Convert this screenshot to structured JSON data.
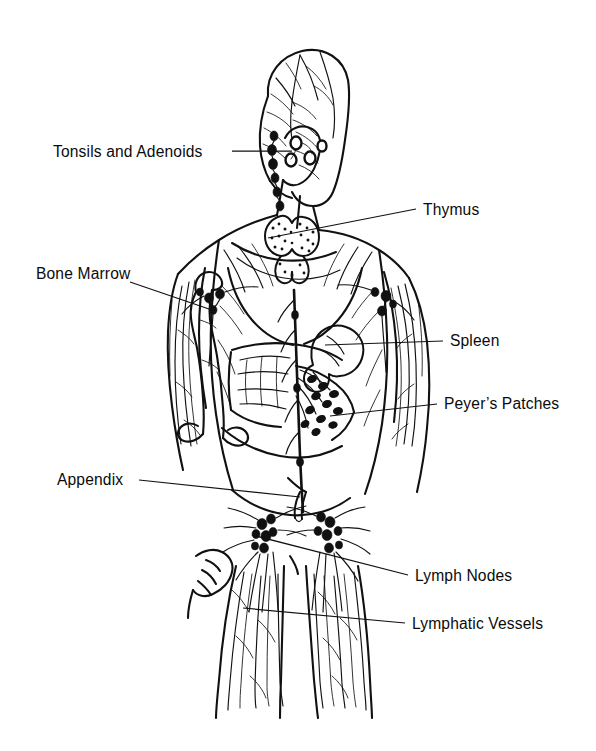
{
  "figure": {
    "view": "posterior full-body line drawing",
    "background_color": "#ffffff",
    "ink_color": "#111111"
  },
  "labels": [
    {
      "id": "tonsils-and-adenoids",
      "text": "Tonsils and Adenoids",
      "side": "left",
      "text_x": 53,
      "text_y": 144,
      "leader": {
        "x1": 232,
        "y1": 151,
        "x2": 292,
        "y2": 151
      }
    },
    {
      "id": "thymus",
      "text": "Thymus",
      "side": "right",
      "text_x": 423,
      "text_y": 202,
      "leader": {
        "x1": 416,
        "y1": 209,
        "x2": 268,
        "y2": 238
      }
    },
    {
      "id": "bone-marrow",
      "text": "Bone Marrow",
      "side": "left",
      "text_x": 36,
      "text_y": 266,
      "leader": {
        "x1": 130,
        "y1": 282,
        "x2": 209,
        "y2": 309
      }
    },
    {
      "id": "spleen",
      "text": "Spleen",
      "side": "right",
      "text_x": 450,
      "text_y": 333,
      "leader": {
        "x1": 443,
        "y1": 341,
        "x2": 325,
        "y2": 345
      }
    },
    {
      "id": "peyers-patches",
      "text": "Peyer’s Patches",
      "side": "right",
      "text_x": 444,
      "text_y": 396,
      "leader": {
        "x1": 437,
        "y1": 404,
        "x2": 330,
        "y2": 416
      }
    },
    {
      "id": "appendix",
      "text": "Appendix",
      "side": "left",
      "text_x": 57,
      "text_y": 472,
      "leader": {
        "x1": 139,
        "y1": 480,
        "x2": 300,
        "y2": 497
      }
    },
    {
      "id": "lymph-nodes",
      "text": "Lymph Nodes",
      "side": "right",
      "text_x": 415,
      "text_y": 568,
      "leader": {
        "x1": 408,
        "y1": 575,
        "x2": 252,
        "y2": 535
      }
    },
    {
      "id": "lymphatic-vessels",
      "text": "Lymphatic Vessels",
      "side": "right",
      "text_x": 412,
      "text_y": 616,
      "leader": {
        "x1": 405,
        "y1": 623,
        "x2": 243,
        "y2": 608
      }
    }
  ],
  "structures": [
    {
      "name": "head",
      "description": "head in three-quarter rear view with scalp lymphatic vessels"
    },
    {
      "name": "tonsils-adenoids-cluster",
      "description": "ring nodes at the jaw and upper neck"
    },
    {
      "name": "cervical-chain",
      "description": "chain of dark nodes down the side of the neck"
    },
    {
      "name": "thymus",
      "description": "bilobed stippled butterfly-shaped gland behind the sternum"
    },
    {
      "name": "spleen",
      "description": "kidney-shaped organ at the left upper abdomen"
    },
    {
      "name": "peyers-patches",
      "description": "oval nodules clustered along the small intestine"
    },
    {
      "name": "appendix",
      "description": "small pouch at the lower right abdomen"
    },
    {
      "name": "bone-marrow",
      "description": "long bone of the upper arm with marrow cavity"
    },
    {
      "name": "axillary-nodes",
      "description": "dense node cluster in each armpit"
    },
    {
      "name": "inguinal-nodes",
      "description": "dense node clusters in both groins with radiating vessels"
    },
    {
      "name": "thoracic-duct",
      "description": "heavy vertical duct running up the midline of the trunk"
    },
    {
      "name": "lymphatic-vessels",
      "description": "fine branching vessels covering arms, trunk and legs"
    }
  ]
}
